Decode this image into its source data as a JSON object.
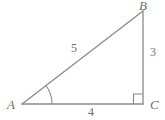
{
  "figure": {
    "kind": "right-triangle-diagram",
    "background_color": "#ffffff",
    "stroke_color": "#8a8a8a",
    "label_color": "#6f6f6f",
    "vertices": [
      {
        "id": "A",
        "label": "A",
        "x": 22,
        "y": 104
      },
      {
        "id": "B",
        "label": "B",
        "x": 143,
        "y": 11
      },
      {
        "id": "C",
        "label": "C",
        "x": 143,
        "y": 104
      }
    ],
    "sides": [
      {
        "id": "hypotenuse",
        "from": "A",
        "to": "B",
        "label": "5"
      },
      {
        "id": "vertical-leg",
        "from": "B",
        "to": "C",
        "label": "3"
      },
      {
        "id": "base-leg",
        "from": "A",
        "to": "C",
        "label": "4"
      }
    ],
    "angles": [
      {
        "id": "angle-a",
        "at": "A",
        "marker": "arc"
      },
      {
        "id": "angle-c",
        "at": "C",
        "marker": "right-angle-square"
      }
    ]
  }
}
